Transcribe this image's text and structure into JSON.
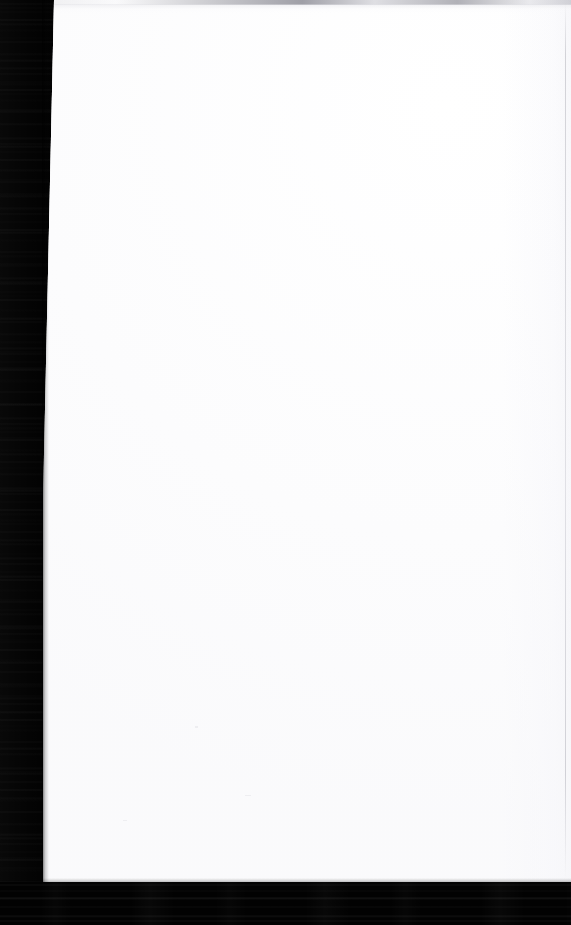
{
  "document": {
    "kind": "scanned-page",
    "title": "",
    "body_text": "",
    "page_number": "",
    "visible_text": "",
    "note": "Blank scanned sheet — no rendered text, headings, figures or captions are present in the pixels."
  },
  "canvas": {
    "width_px": 571,
    "height_px": 925,
    "background_color": "#010101"
  },
  "sheet": {
    "color": "#ffffff",
    "left_edge_top_px": 54,
    "left_edge_bottom_px": 43,
    "right_edge_px": 571,
    "top_edge_px": 0,
    "bottom_edge_px": 883
  },
  "artifacts": {
    "scanner_bed_color": "#010101",
    "left_gutter_label": "scanner-bed-left-gutter",
    "bottom_band_label": "scanner-bed-bottom-band",
    "top_scanline_color": "#8d8d96",
    "right_rule_color": "#b4b4bc"
  }
}
